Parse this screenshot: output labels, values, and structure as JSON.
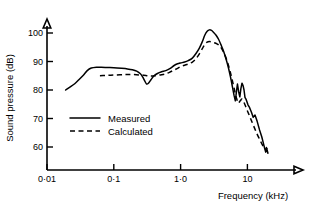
{
  "chart_data": {
    "type": "line",
    "title": "",
    "xlabel": "Frequency   (kHz)",
    "ylabel": "Sound pressure   (dB)",
    "xscale": "log",
    "xlim": [
      0.01,
      40
    ],
    "ylim": [
      55,
      105
    ],
    "grid": false,
    "legend_position": "center-left",
    "xticks": [
      {
        "value": 0.01,
        "label": "0·01"
      },
      {
        "value": 0.1,
        "label": "0·1"
      },
      {
        "value": 1.0,
        "label": "1·0"
      },
      {
        "value": 10,
        "label": "10"
      }
    ],
    "yticks": [
      {
        "value": 60,
        "label": "60"
      },
      {
        "value": 70,
        "label": "70"
      },
      {
        "value": 80,
        "label": "80"
      },
      {
        "value": 90,
        "label": "90"
      },
      {
        "value": 100,
        "label": "100"
      }
    ],
    "series": [
      {
        "name": "Measured",
        "style": "solid",
        "color": "#000000",
        "x": [
          0.019,
          0.022,
          0.026,
          0.03,
          0.035,
          0.04,
          0.046,
          0.055,
          0.065,
          0.08,
          0.1,
          0.13,
          0.16,
          0.19,
          0.22,
          0.25,
          0.27,
          0.29,
          0.31,
          0.33,
          0.36,
          0.4,
          0.45,
          0.52,
          0.6,
          0.7,
          0.8,
          0.9,
          1.0,
          1.15,
          1.3,
          1.5,
          1.7,
          1.9,
          2.1,
          2.3,
          2.5,
          2.7,
          2.9,
          3.1,
          3.4,
          3.7,
          4.0,
          4.4,
          4.8,
          5.2,
          5.6,
          6.0,
          6.3,
          6.6,
          6.9,
          7.1,
          7.4,
          7.7,
          8.0,
          8.3,
          8.6,
          8.9,
          9.2,
          9.6,
          10.2,
          10.8,
          11.5,
          12.2,
          13.0,
          14.0,
          15.2,
          16.4,
          17.4,
          18.2,
          18.8,
          19.3,
          19.8,
          20.3
        ],
        "y": [
          80.0,
          81.0,
          82.2,
          83.6,
          85.2,
          86.8,
          87.7,
          88.0,
          88.0,
          87.9,
          87.8,
          87.6,
          87.4,
          87.1,
          86.6,
          85.7,
          84.6,
          83.2,
          82.1,
          82.4,
          83.6,
          85.0,
          85.8,
          86.4,
          86.8,
          87.6,
          88.6,
          89.2,
          89.5,
          89.8,
          90.3,
          91.2,
          92.8,
          94.6,
          96.8,
          99.2,
          100.6,
          101.1,
          100.9,
          100.3,
          99.2,
          97.8,
          96.0,
          93.6,
          90.8,
          87.8,
          84.4,
          80.8,
          78.2,
          76.2,
          80.0,
          82.1,
          79.4,
          77.6,
          80.6,
          82.4,
          81.6,
          80.0,
          77.4,
          76.6,
          74.8,
          73.8,
          72.2,
          70.4,
          71.2,
          69.0,
          66.0,
          63.6,
          61.2,
          59.4,
          58.2,
          59.8,
          58.8,
          57.8
        ]
      },
      {
        "name": "Calculated",
        "style": "dashed",
        "color": "#000000",
        "x": [
          0.062,
          0.075,
          0.09,
          0.11,
          0.14,
          0.17,
          0.2,
          0.24,
          0.28,
          0.32,
          0.36,
          0.42,
          0.5,
          0.58,
          0.68,
          0.8,
          0.9,
          1.0,
          1.15,
          1.3,
          1.5,
          1.7,
          1.9,
          2.1,
          2.3,
          2.5,
          2.7,
          2.9,
          3.2,
          3.5,
          3.8,
          4.1,
          4.5,
          4.9,
          5.3,
          5.7,
          6.1,
          6.5,
          6.9,
          7.3,
          7.8,
          8.3,
          8.9,
          9.5,
          10.2,
          11.0,
          11.8,
          12.7,
          13.8,
          15.0,
          16.2,
          17.4,
          18.4,
          19.2,
          19.9
        ],
        "y": [
          85.0,
          85.1,
          85.2,
          85.3,
          85.4,
          85.4,
          85.4,
          85.3,
          85.2,
          85.0,
          84.9,
          85.0,
          85.3,
          85.6,
          86.2,
          87.0,
          87.6,
          88.2,
          88.7,
          89.1,
          89.8,
          91.0,
          92.6,
          94.4,
          96.0,
          96.8,
          97.0,
          96.9,
          96.6,
          96.2,
          95.6,
          94.6,
          92.8,
          90.6,
          88.0,
          85.2,
          82.2,
          79.4,
          77.0,
          75.4,
          76.2,
          76.8,
          75.6,
          74.0,
          72.2,
          70.4,
          68.6,
          66.8,
          64.8,
          63.0,
          61.4,
          60.0,
          59.4,
          59.2,
          59.6
        ]
      }
    ]
  },
  "legend": {
    "entries": [
      {
        "label": "Measured",
        "style": "solid"
      },
      {
        "label": "Calculated",
        "style": "dashed"
      }
    ]
  }
}
